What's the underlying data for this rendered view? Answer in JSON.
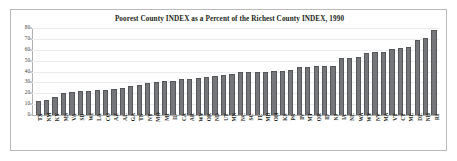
{
  "chart_data": {
    "type": "bar",
    "title": "Poorest County INDEX as a Percent of the Richest County INDEX, 1990",
    "xlabel": "",
    "ylabel": "",
    "ylim": [
      0,
      80
    ],
    "yticks": [
      0,
      10,
      20,
      30,
      40,
      50,
      60,
      70,
      80
    ],
    "grid": true,
    "legend_position": "none",
    "categories": [
      "TX",
      "NM",
      "KY",
      "MS",
      "VA",
      "SD",
      "WI",
      "LA",
      "CO",
      "AZ",
      "AL",
      "GA",
      "TN",
      "NY",
      "MO",
      "MI",
      "IL",
      "CA",
      "AR",
      "WV",
      "OK",
      "ND",
      "UT",
      "MN",
      "NC",
      "SC",
      "FL",
      "MD",
      "OH",
      "KS",
      "PA",
      "IN",
      "MT",
      "OR",
      "ID",
      "NJ",
      "IA",
      "NE",
      "WA",
      "WY",
      "NV",
      "MA",
      "VT",
      "CT",
      "ME",
      "DE",
      "NH",
      "RI"
    ],
    "values": [
      13,
      14,
      17,
      20,
      21,
      22,
      22,
      23,
      23,
      24,
      25,
      27,
      28,
      29,
      30,
      31,
      31,
      33,
      33,
      34,
      35,
      36,
      37,
      38,
      39.5,
      39.5,
      40,
      40,
      40.5,
      40.5,
      41.5,
      44,
      44.5,
      45,
      45.5,
      45.5,
      52,
      52,
      53,
      57,
      57.5,
      58,
      60.5,
      62,
      62.5,
      69,
      71,
      78
    ]
  }
}
